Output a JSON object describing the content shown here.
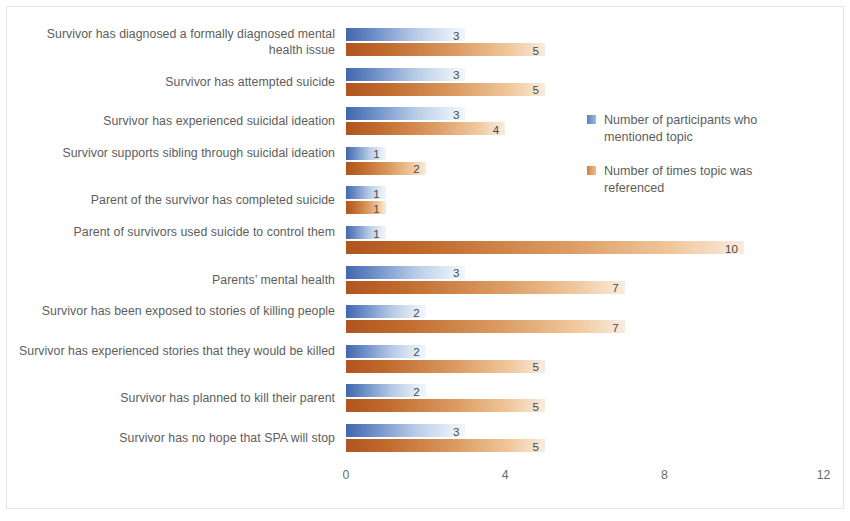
{
  "chart_data": {
    "type": "bar",
    "orientation": "horizontal",
    "title": "",
    "xlabel": "",
    "ylabel": "",
    "xlim": [
      0,
      12
    ],
    "xticks": [
      "0",
      "4",
      "8",
      "12"
    ],
    "grid": false,
    "legend_position": "right",
    "categories": [
      "Survivor has diagnosed a formally diagnosed mental health issue",
      "Survivor has attempted suicide",
      "Survivor has experienced suicidal ideation",
      "Survivor supports sibling through suicidal ideation",
      "Parent of the survivor has completed suicide",
      "Parent of survivors used suicide to control them",
      "Parents’ mental health",
      "Survivor has been exposed to stories of killing people",
      "Survivor has experienced stories that they would be killed",
      "Survivor has planned to kill their parent",
      "Survivor has no hope that SPA will stop"
    ],
    "series": [
      {
        "name": "Number of participants who mentioned topic",
        "color": "#4267ad",
        "values": [
          3,
          3,
          3,
          1,
          1,
          1,
          3,
          2,
          2,
          2,
          3
        ]
      },
      {
        "name": "Number of times topic was referenced",
        "color": "#b1541f",
        "values": [
          5,
          5,
          4,
          2,
          1,
          10,
          7,
          7,
          5,
          5,
          5
        ]
      }
    ]
  },
  "legend": {
    "items": [
      {
        "label": "Number of participants who mentioned topic"
      },
      {
        "label": "Number of times topic was referenced"
      }
    ]
  }
}
